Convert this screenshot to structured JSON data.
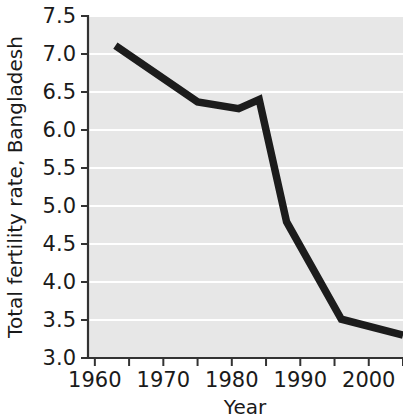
{
  "chart_data": {
    "type": "line",
    "title": "",
    "subtitle": "",
    "xlabel": "Year",
    "ylabel": "Total fertility rate, Bangladesh",
    "xlim": [
      1959,
      2005
    ],
    "ylim": [
      3.0,
      7.5
    ],
    "grid": "horizontal-white-gridlines",
    "legend": "none",
    "plot_background_color": "#e7e7e7",
    "line_color": "#1c1c1c",
    "x_tick_labels": [
      "1960",
      "1970",
      "1980",
      "1990",
      "2000"
    ],
    "x_major_ticks": [
      1960,
      1970,
      1980,
      1990,
      2000
    ],
    "x_minor_ticks": [
      1965,
      1975,
      1985,
      1995,
      2005
    ],
    "y_tick_labels": [
      "3.0",
      "3.5",
      "4.0",
      "4.5",
      "5.0",
      "5.5",
      "6.0",
      "6.5",
      "7.0",
      "7.5"
    ],
    "y_ticks": [
      3.0,
      3.5,
      4.0,
      4.5,
      5.0,
      5.5,
      6.0,
      6.5,
      7.0,
      7.5
    ],
    "series": [
      {
        "name": "Total fertility rate, Bangladesh",
        "x": [
          1963,
          1975,
          1981,
          1984,
          1988,
          1996,
          2005
        ],
        "values": [
          7.11,
          6.37,
          6.28,
          6.4,
          4.79,
          3.51,
          3.3
        ]
      }
    ]
  }
}
